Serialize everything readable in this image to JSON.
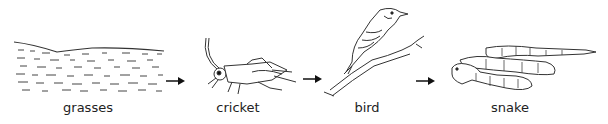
{
  "diagram": {
    "type": "food-chain",
    "organisms": [
      {
        "name": "grasses",
        "label": "grasses",
        "center_x": 88
      },
      {
        "name": "cricket",
        "label": "cricket",
        "center_x": 238
      },
      {
        "name": "bird",
        "label": "bird",
        "center_x": 367
      },
      {
        "name": "snake",
        "label": "snake",
        "center_x": 510
      }
    ],
    "arrows": [
      {
        "from": "grasses",
        "to": "cricket",
        "icon": "arrow-right-icon"
      },
      {
        "from": "cricket",
        "to": "bird",
        "icon": "arrow-right-icon"
      },
      {
        "from": "bird",
        "to": "snake",
        "icon": "arrow-right-icon"
      }
    ],
    "colors": {
      "line": "#333333",
      "arrow": "#111111",
      "text": "#222222"
    }
  }
}
